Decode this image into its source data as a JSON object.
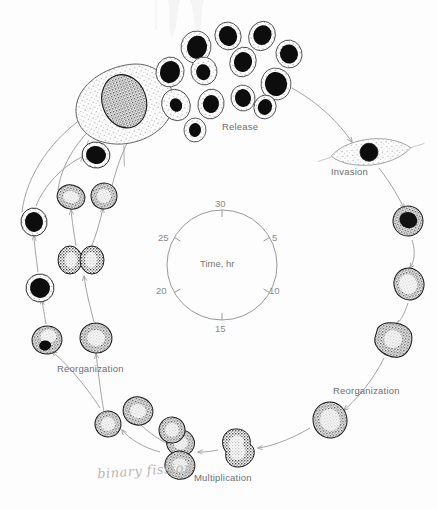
{
  "figure": {
    "kind": "life-cycle-diagram",
    "background_color": "#fdfdfd",
    "ink_color": "#1a1a1a",
    "arc_color": "#9a9a9a",
    "label_color": "#6f6f6f"
  },
  "stage_labels": {
    "release": "Release",
    "invasion": "Invasion",
    "reorganization_right": "Reorganization",
    "reorganization_left": "Reorganization",
    "multiplication": "Multiplication"
  },
  "handwritten_note": {
    "text": "binary fission",
    "color": "#b9b6b4"
  },
  "time_dial": {
    "center_label": "Time, hr",
    "ring_color": "#9a9a9a",
    "tick_label_color": "#8a8a8a",
    "ticks": [
      {
        "value": "5",
        "angle_deg": 60
      },
      {
        "value": "10",
        "angle_deg": 120
      },
      {
        "value": "15",
        "angle_deg": 180
      },
      {
        "value": "20",
        "angle_deg": 240
      },
      {
        "value": "25",
        "angle_deg": 300
      },
      {
        "value": "30",
        "angle_deg": 0
      }
    ]
  },
  "cells": [
    {
      "name": "host-cell-large",
      "stage": "release",
      "cx": 128,
      "cy": 100,
      "rx": 34,
      "ry": 30,
      "nucleus": "speckled",
      "rot": -18
    },
    {
      "name": "merozoite",
      "stage": "release",
      "cx": 196,
      "cy": 47,
      "rx": 15,
      "ry": 16,
      "nucleus": "dark",
      "rot": 10
    },
    {
      "name": "merozoite",
      "stage": "release",
      "cx": 228,
      "cy": 36,
      "rx": 13,
      "ry": 14,
      "nucleus": "dark",
      "rot": -20
    },
    {
      "name": "merozoite",
      "stage": "release",
      "cx": 262,
      "cy": 36,
      "rx": 13,
      "ry": 15,
      "nucleus": "dark",
      "rot": 25
    },
    {
      "name": "merozoite",
      "stage": "release",
      "cx": 289,
      "cy": 54,
      "rx": 13,
      "ry": 14,
      "nucleus": "dark",
      "rot": -15
    },
    {
      "name": "merozoite",
      "stage": "release",
      "cx": 170,
      "cy": 72,
      "rx": 14,
      "ry": 15,
      "nucleus": "dark",
      "rot": 15
    },
    {
      "name": "merozoite",
      "stage": "release",
      "cx": 204,
      "cy": 71,
      "rx": 13,
      "ry": 14,
      "nucleus": "dark",
      "rot": -12
    },
    {
      "name": "merozoite",
      "stage": "release",
      "cx": 243,
      "cy": 62,
      "rx": 13,
      "ry": 15,
      "nucleus": "dark",
      "rot": 18
    },
    {
      "name": "merozoite",
      "stage": "release",
      "cx": 276,
      "cy": 84,
      "rx": 15,
      "ry": 16,
      "nucleus": "dark",
      "rot": -8
    },
    {
      "name": "merozoite",
      "stage": "release",
      "cx": 176,
      "cy": 105,
      "rx": 14,
      "ry": 16,
      "nucleus": "dark",
      "rot": -25
    },
    {
      "name": "merozoite",
      "stage": "release",
      "cx": 211,
      "cy": 104,
      "rx": 13,
      "ry": 15,
      "nucleus": "dark",
      "rot": 12
    },
    {
      "name": "merozoite",
      "stage": "release",
      "cx": 243,
      "cy": 98,
      "rx": 12,
      "ry": 13,
      "nucleus": "dark",
      "rot": -10
    },
    {
      "name": "merozoite",
      "stage": "release",
      "cx": 265,
      "cy": 107,
      "rx": 11,
      "ry": 12,
      "nucleus": "dark",
      "rot": 20
    },
    {
      "name": "merozoite",
      "stage": "release",
      "cx": 195,
      "cy": 130,
      "rx": 11,
      "ry": 12,
      "nucleus": "dark",
      "rot": 5
    },
    {
      "name": "infected-host-cell",
      "stage": "invasion",
      "cx": 371,
      "cy": 152,
      "rx": 38,
      "ry": 12,
      "nucleus": "dark",
      "rot": -6
    },
    {
      "name": "trophozoite",
      "stage": "reorganization-right",
      "cx": 408,
      "cy": 221,
      "rx": 15,
      "ry": 15,
      "nucleus": "dark-speckled",
      "rot": 20
    },
    {
      "name": "trophozoite",
      "stage": "reorganization-right",
      "cx": 409,
      "cy": 284,
      "rx": 15,
      "ry": 16,
      "nucleus": "pale-speckled",
      "rot": -15
    },
    {
      "name": "schizont",
      "stage": "reorganization-right",
      "cx": 393,
      "cy": 339,
      "rx": 17,
      "ry": 17,
      "nucleus": "pale-speckled",
      "rot": 10
    },
    {
      "name": "schizont",
      "stage": "multiplication",
      "cx": 330,
      "cy": 420,
      "rx": 17,
      "ry": 18,
      "nucleus": "pale-speckled",
      "rot": -10
    },
    {
      "name": "dividing-cell",
      "stage": "multiplication",
      "cx": 238,
      "cy": 448,
      "rx": 15,
      "ry": 18,
      "nucleus": "lobed",
      "rot": 0
    },
    {
      "name": "dividing-cell",
      "stage": "multiplication",
      "cx": 180,
      "cy": 455,
      "rx": 16,
      "ry": 19,
      "nucleus": "lobed",
      "rot": 12
    },
    {
      "name": "daughter-cell",
      "stage": "multiplication",
      "cx": 172,
      "cy": 430,
      "rx": 13,
      "ry": 13,
      "nucleus": "pale-speckled",
      "rot": -8
    },
    {
      "name": "daughter-cell",
      "stage": "multiplication",
      "cx": 138,
      "cy": 411,
      "rx": 15,
      "ry": 14,
      "nucleus": "pale-speckled",
      "rot": 18
    },
    {
      "name": "daughter-cell",
      "stage": "multiplication",
      "cx": 108,
      "cy": 424,
      "rx": 13,
      "ry": 13,
      "nucleus": "pale-speckled",
      "rot": -14
    },
    {
      "name": "trophozoite",
      "stage": "reorganization-left",
      "cx": 96,
      "cy": 338,
      "rx": 16,
      "ry": 15,
      "nucleus": "pale-speckled",
      "rot": 8
    },
    {
      "name": "trophozoite",
      "stage": "reorganization-left",
      "cx": 47,
      "cy": 340,
      "rx": 15,
      "ry": 14,
      "nucleus": "dark-half",
      "rot": -12
    },
    {
      "name": "dividing-cell",
      "stage": "reorganization-left",
      "cx": 81,
      "cy": 260,
      "rx": 20,
      "ry": 14,
      "nucleus": "lobed",
      "rot": 0
    },
    {
      "name": "trophozoite",
      "stage": "reorganization-left",
      "cx": 40,
      "cy": 288,
      "rx": 14,
      "ry": 14,
      "nucleus": "dark",
      "rot": 10
    },
    {
      "name": "trophozoite",
      "stage": "reorganization-left",
      "cx": 34,
      "cy": 222,
      "rx": 13,
      "ry": 14,
      "nucleus": "dark",
      "rot": -10
    },
    {
      "name": "trophozoite",
      "stage": "reorganization-left",
      "cx": 71,
      "cy": 197,
      "rx": 14,
      "ry": 12,
      "nucleus": "pale-speckled",
      "rot": 15
    },
    {
      "name": "trophozoite",
      "stage": "reorganization-left",
      "cx": 104,
      "cy": 196,
      "rx": 13,
      "ry": 13,
      "nucleus": "pale-speckled",
      "rot": -18
    },
    {
      "name": "trophozoite",
      "stage": "reorganization-left",
      "cx": 96,
      "cy": 155,
      "rx": 14,
      "ry": 13,
      "nucleus": "dark",
      "rot": 12
    }
  ]
}
